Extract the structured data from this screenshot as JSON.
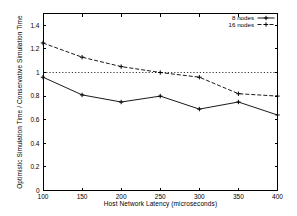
{
  "chart_data": {
    "type": "line",
    "title": "",
    "xlabel": "Host Network Latency (microseconds)",
    "ylabel": "Optimistic Simulation Time / Conservative Simulation Time",
    "x": [
      100,
      150,
      200,
      250,
      300,
      350,
      400
    ],
    "series": [
      {
        "name": "8 nodes",
        "style": "solid",
        "marker": "plus",
        "values": [
          0.96,
          0.81,
          0.75,
          0.8,
          0.69,
          0.75,
          0.64
        ]
      },
      {
        "name": "16 nodes",
        "style": "dashed",
        "marker": "plus",
        "values": [
          1.25,
          1.13,
          1.05,
          1.0,
          0.96,
          0.82,
          0.8
        ]
      }
    ],
    "reference_line": {
      "y": 1,
      "style": "dotted"
    },
    "xlim": [
      100,
      400
    ],
    "ylim": [
      0,
      1.5
    ],
    "xticks": [
      100,
      150,
      200,
      250,
      300,
      350,
      400
    ],
    "xtick_labels": [
      "100",
      "150",
      "200",
      "250",
      "300",
      "350",
      "400"
    ],
    "yticks": [
      0,
      0.2,
      0.4,
      0.6,
      0.8,
      1,
      1.2,
      1.4
    ],
    "ytick_labels": [
      "0",
      "0.2",
      "0.4",
      "0.6",
      "0.8",
      "1",
      "1.2",
      "1.4"
    ],
    "legend_position": "top-right",
    "grid": false,
    "colors": {
      "line": "#000000",
      "background": "#ffffff",
      "text": "#000000"
    }
  }
}
